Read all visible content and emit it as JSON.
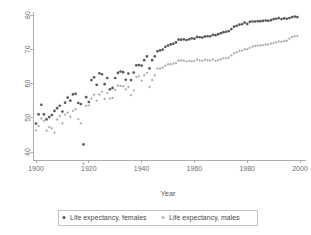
{
  "chart_data": {
    "type": "scatter",
    "title": "",
    "xlabel": "Year",
    "ylabel": "",
    "xlim": [
      1898,
      2001
    ],
    "ylim": [
      36,
      81
    ],
    "xticks": [
      1900,
      1920,
      1940,
      1960,
      1980,
      2000
    ],
    "xticklabels": [
      "1900",
      "1920",
      "1940",
      "1960",
      "1980",
      "2000"
    ],
    "yticks": [
      40,
      50,
      60,
      70,
      80
    ],
    "yticklabels": [
      "40",
      "50",
      "60",
      "70",
      "80"
    ],
    "grid": false,
    "legend_position": "below",
    "legend": [
      "Life expectancy, females",
      "Life expectancy, males"
    ],
    "series": [
      {
        "name": "Life expectancy, females",
        "color": "#585858",
        "marker": "circle",
        "x": [
          1900,
          1901,
          1902,
          1903,
          1904,
          1905,
          1906,
          1907,
          1908,
          1909,
          1910,
          1911,
          1912,
          1913,
          1914,
          1915,
          1916,
          1917,
          1918,
          1919,
          1920,
          1921,
          1922,
          1923,
          1924,
          1925,
          1926,
          1927,
          1928,
          1929,
          1930,
          1931,
          1932,
          1933,
          1934,
          1935,
          1936,
          1937,
          1938,
          1939,
          1940,
          1941,
          1942,
          1943,
          1944,
          1945,
          1946,
          1947,
          1948,
          1949,
          1950,
          1951,
          1952,
          1953,
          1954,
          1955,
          1956,
          1957,
          1958,
          1959,
          1960,
          1961,
          1962,
          1963,
          1964,
          1965,
          1966,
          1967,
          1968,
          1969,
          1970,
          1971,
          1972,
          1973,
          1974,
          1975,
          1976,
          1977,
          1978,
          1979,
          1980,
          1981,
          1982,
          1983,
          1984,
          1985,
          1986,
          1987,
          1988,
          1989,
          1990,
          1991,
          1992,
          1993,
          1994,
          1995,
          1996,
          1997,
          1998,
          1999
        ],
        "y": [
          48.3,
          51.0,
          53.8,
          51.0,
          49.5,
          50.2,
          50.8,
          52.0,
          52.8,
          53.5,
          51.8,
          54.4,
          55.9,
          55.0,
          56.8,
          57.0,
          54.3,
          54.0,
          42.2,
          56.0,
          54.6,
          61.0,
          61.8,
          59.6,
          63.0,
          62.7,
          59.8,
          61.6,
          58.3,
          58.7,
          61.6,
          63.1,
          63.5,
          63.3,
          61.1,
          62.9,
          61.0,
          63.2,
          65.3,
          65.4,
          65.2,
          66.8,
          67.9,
          64.4,
          66.8,
          67.9,
          69.4,
          69.7,
          69.9,
          70.7,
          71.1,
          71.4,
          71.6,
          72.0,
          72.8,
          72.8,
          72.9,
          72.7,
          72.9,
          73.2,
          73.1,
          73.6,
          73.5,
          73.4,
          73.7,
          73.8,
          73.8,
          74.2,
          74.1,
          74.4,
          74.7,
          75.0,
          75.1,
          75.3,
          75.9,
          76.6,
          76.8,
          77.2,
          77.3,
          77.8,
          77.4,
          78.0,
          78.1,
          78.1,
          78.2,
          78.2,
          78.3,
          78.4,
          78.3,
          78.5,
          78.8,
          78.9,
          79.1,
          78.8,
          79.0,
          78.9,
          79.1,
          79.4,
          79.5,
          79.4
        ]
      },
      {
        "name": "Life expectancy, males",
        "color": "#b0b0b0",
        "marker": "diamond",
        "x": [
          1900,
          1901,
          1902,
          1903,
          1904,
          1905,
          1906,
          1907,
          1908,
          1909,
          1910,
          1911,
          1912,
          1913,
          1914,
          1915,
          1916,
          1917,
          1918,
          1919,
          1920,
          1921,
          1922,
          1923,
          1924,
          1925,
          1926,
          1927,
          1928,
          1929,
          1930,
          1931,
          1932,
          1933,
          1934,
          1935,
          1936,
          1937,
          1938,
          1939,
          1940,
          1941,
          1942,
          1943,
          1944,
          1945,
          1946,
          1947,
          1948,
          1949,
          1950,
          1951,
          1952,
          1953,
          1954,
          1955,
          1956,
          1957,
          1958,
          1959,
          1960,
          1961,
          1962,
          1963,
          1964,
          1965,
          1966,
          1967,
          1968,
          1969,
          1970,
          1971,
          1972,
          1973,
          1974,
          1975,
          1976,
          1977,
          1978,
          1979,
          1980,
          1981,
          1982,
          1983,
          1984,
          1985,
          1986,
          1987,
          1988,
          1989,
          1990,
          1991,
          1992,
          1993,
          1994,
          1995,
          1996,
          1997,
          1998,
          1999
        ],
        "y": [
          46.3,
          47.6,
          49.8,
          49.1,
          46.2,
          47.3,
          46.9,
          45.6,
          49.5,
          50.5,
          48.4,
          50.9,
          51.5,
          50.3,
          52.0,
          52.5,
          49.6,
          48.4,
          36.6,
          53.5,
          53.6,
          55.6,
          56.7,
          55.0,
          56.8,
          57.6,
          55.5,
          57.2,
          55.6,
          55.8,
          58.1,
          59.4,
          59.3,
          59.2,
          58.3,
          59.0,
          56.6,
          58.0,
          61.9,
          62.1,
          60.8,
          62.4,
          63.1,
          59.0,
          61.0,
          62.4,
          64.4,
          64.4,
          64.6,
          65.2,
          65.6,
          65.6,
          65.8,
          66.0,
          66.7,
          66.7,
          66.7,
          66.4,
          66.6,
          66.5,
          66.6,
          67.0,
          66.8,
          66.6,
          66.9,
          66.8,
          66.7,
          67.0,
          66.6,
          66.8,
          67.1,
          67.4,
          67.4,
          67.6,
          68.2,
          68.8,
          69.1,
          69.5,
          69.6,
          70.0,
          70.0,
          70.4,
          70.8,
          71.0,
          71.1,
          71.1,
          71.2,
          71.4,
          71.4,
          71.7,
          71.8,
          72.0,
          72.3,
          72.2,
          72.4,
          72.5,
          73.1,
          73.6,
          73.8,
          73.9
        ]
      }
    ]
  },
  "axis": {
    "y_tick_labels": [
      "80",
      "70",
      "60",
      "50",
      "40"
    ],
    "x_tick_labels": [
      "1900",
      "1920",
      "1940",
      "1960",
      "1980",
      "2000"
    ],
    "x_title": "Year"
  },
  "legend": {
    "items": [
      {
        "label": "Life expectancy, females",
        "marker": "circle-marker",
        "color": "#585858"
      },
      {
        "label": "Life expectancy, males",
        "marker": "diamond-marker",
        "color": "#b0b0b0"
      }
    ]
  }
}
